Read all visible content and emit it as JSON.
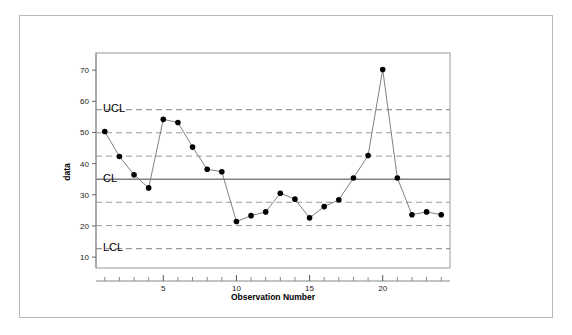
{
  "figure": {
    "background_color": "#ffffff",
    "border_color": "#b9b9b9"
  },
  "chart_data": {
    "type": "line",
    "title": "",
    "xlabel": "Observation Number",
    "ylabel": "data",
    "x": [
      1,
      2,
      3,
      4,
      5,
      6,
      7,
      8,
      9,
      10,
      11,
      12,
      13,
      14,
      15,
      16,
      17,
      18,
      19,
      20,
      21,
      22,
      23,
      24
    ],
    "values": [
      50.3,
      42.3,
      36.4,
      32.2,
      54.2,
      53.2,
      45.3,
      38.2,
      37.4,
      21.4,
      23.3,
      24.5,
      30.5,
      28.6,
      22.6,
      26.2,
      28.4,
      35.4,
      42.6,
      70.2,
      35.4,
      23.6,
      24.5,
      23.6
    ],
    "series": [
      {
        "name": "data",
        "values": [
          50.3,
          42.3,
          36.4,
          32.2,
          54.2,
          53.2,
          45.3,
          38.2,
          37.4,
          21.4,
          23.3,
          24.5,
          30.5,
          28.6,
          22.6,
          26.2,
          28.4,
          35.4,
          42.6,
          70.2,
          35.4,
          23.6,
          24.5,
          23.6
        ]
      }
    ],
    "xlim": [
      0.4,
      24.6
    ],
    "ylim": [
      6.5,
      75.5
    ],
    "xticks": [
      5,
      10,
      15,
      20
    ],
    "xtick_labels": [
      "5",
      "10",
      "15",
      "20"
    ],
    "yticks": [
      10,
      20,
      30,
      40,
      50,
      60,
      70
    ],
    "ytick_labels": [
      "10",
      "20",
      "30",
      "40",
      "50",
      "60",
      "70"
    ],
    "xtick_minor": [
      1,
      2,
      3,
      4,
      6,
      7,
      8,
      9,
      11,
      12,
      13,
      14,
      16,
      17,
      18,
      19,
      21,
      22,
      23,
      24
    ],
    "grid": false,
    "legend": "none",
    "marker": "filled-circle",
    "marker_color": "#000000",
    "line_color": "#808080",
    "control_limits": {
      "center_line": {
        "label": "CL",
        "value": 35.0,
        "style": "solid",
        "color": "#808080"
      },
      "upper_control_limit": {
        "label": "UCL",
        "value": 57.3,
        "style": "dashed",
        "color": "#808080"
      },
      "lower_control_limit": {
        "label": "LCL",
        "value": 12.7,
        "style": "dashed",
        "color": "#808080"
      },
      "sigma_zones": [
        {
          "value": 49.9,
          "style": "dashed",
          "color": "#9a9a9a"
        },
        {
          "value": 42.4,
          "style": "dashed",
          "color": "#9a9a9a"
        },
        {
          "value": 27.6,
          "style": "dashed",
          "color": "#9a9a9a"
        },
        {
          "value": 20.1,
          "style": "dashed",
          "color": "#9a9a9a"
        }
      ]
    },
    "out_of_control_points": [
      {
        "x": 20,
        "y": 70.2
      }
    ]
  }
}
